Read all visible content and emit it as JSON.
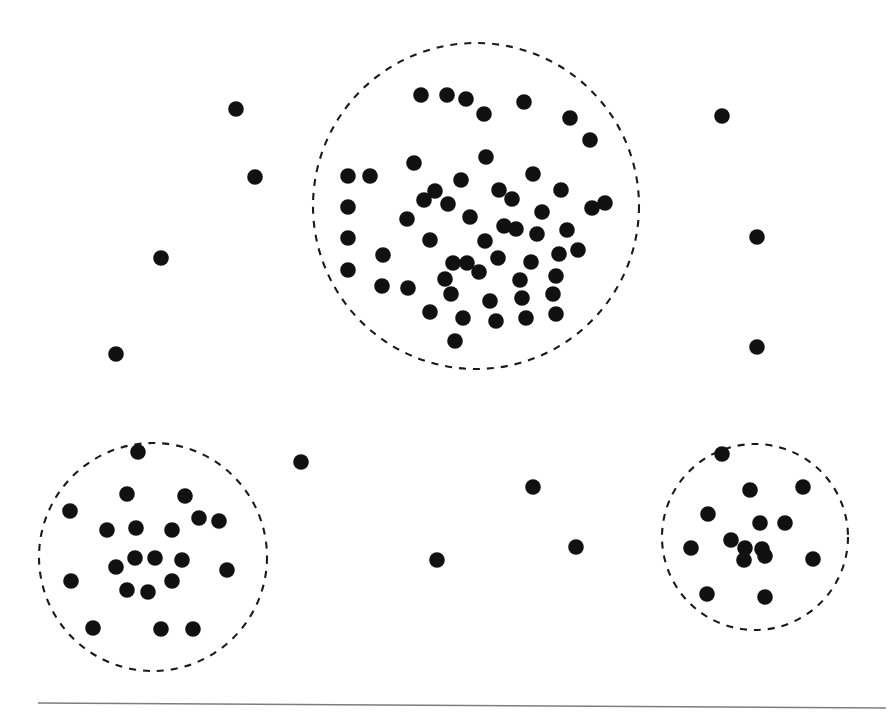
{
  "figure": {
    "width": 893,
    "height": 718,
    "background_color": "#ffffff",
    "point_color": "#111111",
    "boundary_color": "#1a1a1a",
    "rule_color": "#7d7d7d",
    "point_radius": 7.8,
    "boundary_stroke_width": 2.1,
    "boundary_dash": "7 7"
  },
  "baseline_rule": {
    "name": "horizontal-rule",
    "x1": 38,
    "y1": 703,
    "x2": 886,
    "y2": 708,
    "stroke_width": 1.4
  },
  "chart_data": {
    "type": "scatter",
    "xlabel": "",
    "ylabel": "",
    "xlim": [
      0,
      893
    ],
    "ylim": [
      0,
      718
    ],
    "grid": false,
    "legend": null,
    "marker": "filled-circle",
    "marker_size": 7.8,
    "coordinate_system": "pixel, y increases downward",
    "cluster_boundaries": [
      {
        "name": "cluster-a-boundary",
        "label": "top cluster",
        "shape": "circle",
        "cx": 476,
        "cy": 206,
        "r": 163,
        "style": "dashed",
        "point_count": 56
      },
      {
        "name": "cluster-b-boundary",
        "label": "bottom-left cluster",
        "shape": "circle",
        "cx": 153,
        "cy": 557,
        "r": 114,
        "style": "dashed",
        "point_count": 21
      },
      {
        "name": "cluster-c-boundary",
        "label": "bottom-right cluster",
        "shape": "circle",
        "cx": 755,
        "cy": 537,
        "r": 93,
        "style": "dashed",
        "point_count": 15
      }
    ],
    "series": [
      {
        "name": "cluster-a",
        "label": "Top cluster points",
        "count": 56,
        "points": [
          [
            421,
            95
          ],
          [
            447,
            95
          ],
          [
            466,
            99
          ],
          [
            524,
            102
          ],
          [
            484,
            114
          ],
          [
            570,
            118
          ],
          [
            590,
            140
          ],
          [
            486,
            157
          ],
          [
            414,
            163
          ],
          [
            461,
            180
          ],
          [
            348,
            176
          ],
          [
            370,
            176
          ],
          [
            435,
            191
          ],
          [
            499,
            190
          ],
          [
            561,
            190
          ],
          [
            533,
            174
          ],
          [
            348,
            207
          ],
          [
            424,
            200
          ],
          [
            448,
            204
          ],
          [
            470,
            217
          ],
          [
            512,
            199
          ],
          [
            542,
            212
          ],
          [
            592,
            208
          ],
          [
            605,
            203
          ],
          [
            348,
            238
          ],
          [
            407,
            219
          ],
          [
            485,
            241
          ],
          [
            516,
            229
          ],
          [
            537,
            234
          ],
          [
            567,
            230
          ],
          [
            348,
            270
          ],
          [
            383,
            255
          ],
          [
            453,
            263
          ],
          [
            467,
            263
          ],
          [
            498,
            258
          ],
          [
            531,
            262
          ],
          [
            559,
            254
          ],
          [
            578,
            250
          ],
          [
            430,
            240
          ],
          [
            504,
            226
          ],
          [
            445,
            279
          ],
          [
            479,
            272
          ],
          [
            520,
            280
          ],
          [
            556,
            276
          ],
          [
            382,
            286
          ],
          [
            408,
            288
          ],
          [
            451,
            294
          ],
          [
            490,
            301
          ],
          [
            522,
            298
          ],
          [
            553,
            294
          ],
          [
            430,
            312
          ],
          [
            463,
            318
          ],
          [
            496,
            321
          ],
          [
            526,
            318
          ],
          [
            556,
            314
          ],
          [
            455,
            341
          ]
        ]
      },
      {
        "name": "cluster-b",
        "label": "Bottom-left cluster points",
        "count": 21,
        "points": [
          [
            138,
            452
          ],
          [
            127,
            494
          ],
          [
            185,
            496
          ],
          [
            70,
            511
          ],
          [
            219,
            521
          ],
          [
            107,
            530
          ],
          [
            136,
            528
          ],
          [
            172,
            530
          ],
          [
            135,
            558
          ],
          [
            155,
            558
          ],
          [
            182,
            560
          ],
          [
            116,
            567
          ],
          [
            71,
            581
          ],
          [
            172,
            581
          ],
          [
            227,
            570
          ],
          [
            127,
            590
          ],
          [
            148,
            592
          ],
          [
            93,
            628
          ],
          [
            161,
            629
          ],
          [
            193,
            629
          ],
          [
            199,
            518
          ]
        ]
      },
      {
        "name": "cluster-c",
        "label": "Bottom-right cluster points",
        "count": 15,
        "points": [
          [
            722,
            454
          ],
          [
            750,
            490
          ],
          [
            803,
            487
          ],
          [
            708,
            514
          ],
          [
            760,
            523
          ],
          [
            785,
            523
          ],
          [
            731,
            540
          ],
          [
            745,
            548
          ],
          [
            762,
            549
          ],
          [
            765,
            556
          ],
          [
            691,
            548
          ],
          [
            813,
            559
          ],
          [
            707,
            594
          ],
          [
            765,
            597
          ],
          [
            744,
            560
          ]
        ]
      },
      {
        "name": "noise",
        "label": "Scattered noise points",
        "count": 11,
        "points": [
          [
            236,
            109
          ],
          [
            255,
            177
          ],
          [
            161,
            258
          ],
          [
            116,
            354
          ],
          [
            722,
            116
          ],
          [
            757,
            237
          ],
          [
            757,
            347
          ],
          [
            301,
            462
          ],
          [
            533,
            487
          ],
          [
            437,
            560
          ],
          [
            576,
            547
          ]
        ]
      }
    ]
  }
}
